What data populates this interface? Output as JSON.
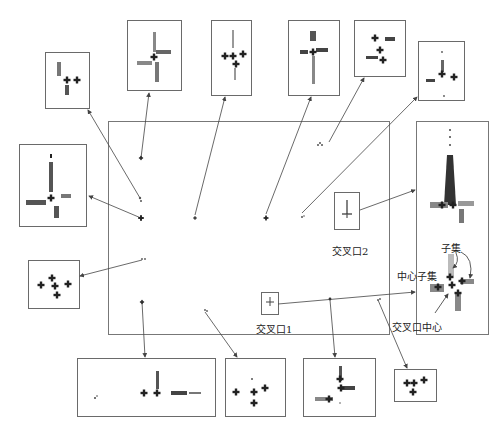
{
  "figure": {
    "type": "intersection clustering diagram",
    "labels": {
      "intersection_1": "交叉口1",
      "intersection_2": "交叉口2",
      "subset": "子集",
      "center_subset": "中心子集",
      "intersection_center": "交叉口中心"
    },
    "colors": {
      "frame": "#6a6a6a",
      "points_dark": "#2a2a2a",
      "points_mid": "#707070",
      "points_light": "#b0b0b0",
      "arrow": "#444444"
    },
    "panels": {
      "main_map": "road network point map",
      "right_detail": "intersection 2 detail with center and subsets",
      "inset_count": 12
    }
  }
}
